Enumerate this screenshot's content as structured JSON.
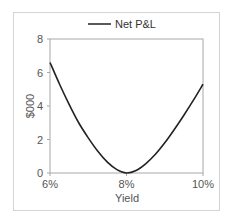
{
  "chart_data": {
    "type": "line",
    "title": "",
    "xlabel": "Yield",
    "ylabel": "$000",
    "legend": [
      "Net P&L"
    ],
    "legend_position": "top",
    "grid": false,
    "xlim": [
      6,
      10
    ],
    "ylim": [
      0,
      8
    ],
    "x_tick_labels": [
      "6%",
      "8%",
      "10%"
    ],
    "y_tick_labels": [
      "0",
      "2",
      "4",
      "6",
      "8"
    ],
    "series": [
      {
        "name": "Net P&L",
        "x": [
          6.0,
          6.25,
          6.5,
          6.75,
          7.0,
          7.25,
          7.5,
          7.75,
          8.0,
          8.25,
          8.5,
          8.75,
          9.0,
          9.25,
          9.5,
          9.75,
          10.0
        ],
        "values": [
          6.6,
          5.3,
          4.1,
          3.0,
          2.1,
          1.3,
          0.65,
          0.2,
          0.0,
          0.15,
          0.55,
          1.1,
          1.8,
          2.6,
          3.45,
          4.35,
          5.3
        ]
      }
    ],
    "colors": {
      "line": "#222222",
      "axis": "#a0a0a0",
      "text": "#555555"
    }
  }
}
